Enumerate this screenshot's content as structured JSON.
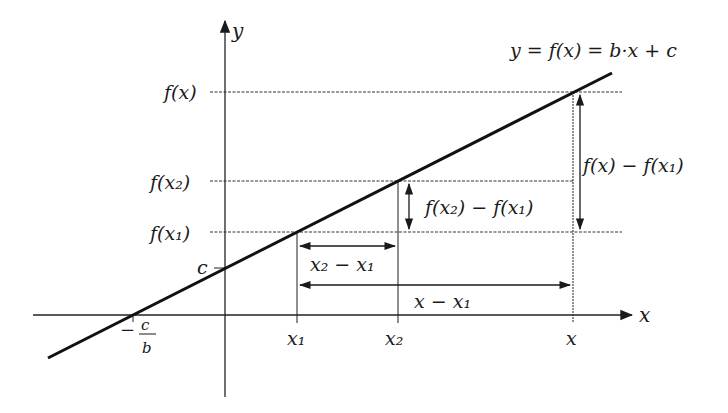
{
  "diagram": {
    "type": "linear-function-graph",
    "equation_label": "y = f(x) = b·x + c",
    "axes": {
      "x_label": "x",
      "y_label": "y"
    },
    "y_ticks": {
      "fx": "f(x)",
      "fx2": "f(x₂)",
      "fx1": "f(x₁)",
      "c": "c"
    },
    "x_ticks": {
      "root": {
        "minus": "−",
        "num": "c",
        "den": "b"
      },
      "x1": "x₁",
      "x2": "x₂",
      "x": "x"
    },
    "dimension_labels": {
      "dx21": "x₂ − x₁",
      "dx1": "x − x₁",
      "df21": "f(x₂) − f(x₁)",
      "df1": "f(x) − f(x₁)"
    },
    "colors": {
      "line": "#111111",
      "axis": "#222222",
      "dashed": "#333333",
      "background": "#ffffff"
    }
  }
}
